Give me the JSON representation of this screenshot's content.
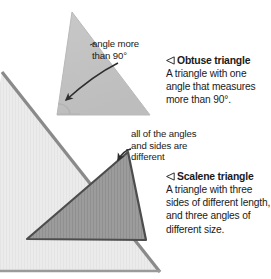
{
  "page": {
    "background_color": "#ffffff",
    "width": 271,
    "height": 279
  },
  "figure": {
    "shapes": [
      {
        "name": "background-triangle",
        "fill": "#eaeaea",
        "stroke": "#7a7a7a",
        "points": "2,72 160,272 -30,272"
      },
      {
        "name": "obtuse-triangle",
        "fill": "#c2c2c2",
        "stroke": "#b0b0b0",
        "points": "72,12 150,115 57,115"
      },
      {
        "name": "scalene-triangle",
        "fill": "#9c9c9c",
        "stroke": "#4a4a4a",
        "points": "128,152 146,240 27,239"
      }
    ]
  },
  "callouts": [
    {
      "name": "obtuse-angle-callout",
      "lines": [
        "angle more",
        "than 90°"
      ],
      "arrow": "curved arrow pointing down-left to the obtuse angle vertex"
    },
    {
      "name": "scalene-sides-callout",
      "lines": [
        "all of the angles",
        "and sides are",
        "different"
      ],
      "arrow": "curved arrow pointing down-left into the scalene triangle"
    }
  ],
  "entries": [
    {
      "name": "obtuse-triangle-entry",
      "marker_icon": "left-pointing-triangle-icon",
      "heading": "Obtuse triangle",
      "body_lines": [
        "A triangle with one",
        "angle that measures",
        "more than 90°."
      ]
    },
    {
      "name": "scalene-triangle-entry",
      "marker_icon": "left-pointing-triangle-icon",
      "heading": "Scalene triangle",
      "body_lines": [
        "A triangle with three",
        "sides of different length,",
        "and three angles of",
        "different size."
      ]
    }
  ],
  "colors": {
    "text": "#1a1a1a",
    "background_triangle": "#eaeaea",
    "obtuse_triangle": "#c2c2c2",
    "scalene_triangle": "#9c9c9c",
    "arrow": "#333333"
  }
}
